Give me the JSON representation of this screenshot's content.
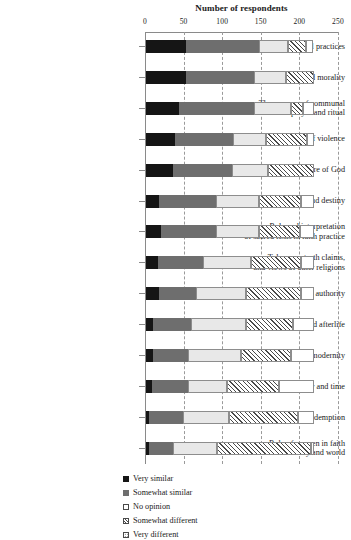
{
  "chart_data": {
    "type": "bar",
    "orientation": "horizontal",
    "stacked": true,
    "title": "Number of respondents",
    "xlabel": "Number of respondents",
    "ylabel": "",
    "xlim": [
      0,
      250
    ],
    "xticks": [
      0,
      50,
      100,
      150,
      200,
      250
    ],
    "grid": true,
    "legend_position": "bottom-center",
    "categories": [
      "The role of personal spiritual practices",
      "Ethics and morality",
      "The purpose of communal prayer and ritual",
      "War and peace/the use of violence",
      "Nature of God",
      "Human nature and destiny",
      "Role and interpretation of sacred texts in faith practice",
      "Tolerance, truth claims, and views of other religions",
      "Source(s) of religious authority",
      "Death and afterlife",
      "Religion, science, modernity",
      "Eschatology and time",
      "Sin and redemption",
      "Role of women in faith community and world"
    ],
    "series": [
      {
        "name": "Very similar",
        "values": [
          52,
          52,
          43,
          38,
          35,
          17,
          19,
          16,
          17,
          9,
          9,
          8,
          4,
          4
        ]
      },
      {
        "name": "Somewhat similar",
        "values": [
          94,
          88,
          97,
          75,
          77,
          74,
          72,
          58,
          48,
          49,
          46,
          46,
          44,
          31
        ]
      },
      {
        "name": "No opinion",
        "values": [
          38,
          41,
          48,
          43,
          46,
          55,
          55,
          62,
          64,
          71,
          68,
          51,
          60,
          57
        ]
      },
      {
        "name": "Somewhat different",
        "values": [
          23,
          37,
          15,
          52,
          59,
          55,
          53,
          65,
          72,
          62,
          65,
          67,
          89,
          122
        ]
      },
      {
        "name": "Very different",
        "values": [
          9,
          0,
          14,
          9,
          0,
          17,
          19,
          17,
          16,
          27,
          30,
          46,
          21,
          4
        ]
      }
    ],
    "totals": [
      216,
      218,
      217,
      217,
      217,
      218,
      218,
      218,
      217,
      218,
      218,
      218,
      218,
      218
    ]
  },
  "axis": {
    "x_tick_labels": [
      "0",
      "50",
      "100",
      "150",
      "200",
      "250"
    ]
  },
  "legend": {
    "items": [
      {
        "label": "Very similar",
        "pattern": "solid-black"
      },
      {
        "label": "Somewhat similar",
        "pattern": "solid-gray"
      },
      {
        "label": "No opinion",
        "pattern": "open-white"
      },
      {
        "label": "Somewhat different",
        "pattern": "diagonal-hatch"
      },
      {
        "label": "Very different",
        "pattern": "dotted"
      }
    ]
  },
  "category_labels": [
    [
      "The role of personal spiritual practices"
    ],
    [
      "Ethics and morality"
    ],
    [
      "The purpose of communal",
      "prayer and ritual"
    ],
    [
      "War and peace/the use of violence"
    ],
    [
      "Nature of God"
    ],
    [
      "Human nature and destiny"
    ],
    [
      "Role and interpretation",
      "of sacred texts in faith practice"
    ],
    [
      "Tolerance, truth claims,",
      "and views of other religions"
    ],
    [
      "Source(s) of religious authority"
    ],
    [
      "Death and afterlife"
    ],
    [
      "Religion, science, modernity"
    ],
    [
      "Eschatology and time"
    ],
    [
      "Sin and redemption"
    ],
    [
      "Role of women in faith",
      "community and world"
    ]
  ],
  "colors": {
    "very_similar": "#151515",
    "somewhat_similar": "#6e6e6e",
    "no_opinion": "#e8e8e8",
    "somewhat_different": "#ffffff",
    "very_different": "#ffffff",
    "axis": "#8a8a8a",
    "grid": "#9a9a9a",
    "background": "#ffffff"
  }
}
